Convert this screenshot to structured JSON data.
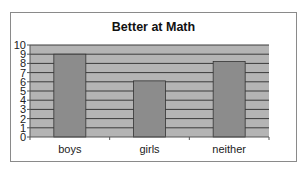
{
  "chart_data": {
    "type": "bar",
    "title": "Better at Math",
    "categories": [
      "boys",
      "girls",
      "neither"
    ],
    "values": [
      9,
      6.1,
      8.2
    ],
    "xlabel": "",
    "ylabel": "",
    "ylim": [
      0,
      10
    ],
    "yticks": [
      0,
      1,
      2,
      3,
      4,
      5,
      6,
      7,
      8,
      9,
      10
    ],
    "grid": true,
    "legend": null,
    "colors": {
      "bar_fill": "#8c8c8c",
      "bar_stroke": "#333333",
      "plot_bg": "#b4b4b4",
      "gridline": "#3a3a3a",
      "frame": "#8a8a8a"
    }
  }
}
